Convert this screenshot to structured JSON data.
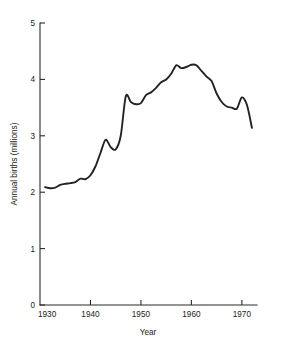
{
  "chart_data": {
    "type": "line",
    "title": "",
    "xlabel": "Year",
    "ylabel": "Annual births (millions)",
    "xlim": [
      1930,
      1973
    ],
    "ylim": [
      0,
      5
    ],
    "grid": false,
    "legend": "none",
    "line_color": "#232323",
    "x_ticks": [
      1930,
      1940,
      1950,
      1960,
      1970
    ],
    "x_tick_labels": [
      "1930",
      "1940",
      "1950",
      "1960",
      "1970"
    ],
    "y_ticks": [
      0,
      1,
      2,
      3,
      4,
      5
    ],
    "y_tick_labels": [
      "0",
      "1",
      "2",
      "3",
      "4",
      "5"
    ],
    "series": [
      {
        "name": "Annual births",
        "x": [
          1931,
          1932,
          1933,
          1934,
          1935,
          1936,
          1937,
          1938,
          1939,
          1940,
          1941,
          1942,
          1943,
          1944,
          1945,
          1946,
          1947,
          1948,
          1949,
          1950,
          1951,
          1952,
          1953,
          1954,
          1955,
          1956,
          1957,
          1958,
          1959,
          1960,
          1961,
          1962,
          1963,
          1964,
          1965,
          1966,
          1967,
          1968,
          1969,
          1970,
          1971,
          1972
        ],
        "values": [
          2.09,
          2.07,
          2.08,
          2.13,
          2.15,
          2.16,
          2.18,
          2.24,
          2.23,
          2.3,
          2.46,
          2.7,
          2.93,
          2.8,
          2.76,
          3.0,
          3.7,
          3.6,
          3.56,
          3.58,
          3.72,
          3.77,
          3.85,
          3.95,
          4.0,
          4.1,
          4.25,
          4.2,
          4.22,
          4.26,
          4.25,
          4.15,
          4.05,
          3.97,
          3.75,
          3.6,
          3.52,
          3.5,
          3.48,
          3.68,
          3.55,
          3.14
        ]
      }
    ],
    "annotations": []
  }
}
